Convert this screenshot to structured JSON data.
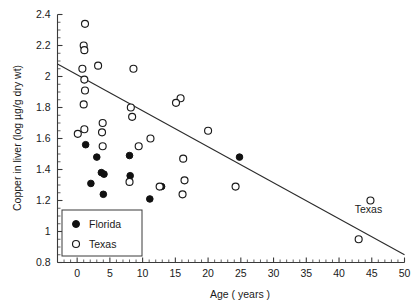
{
  "chart_data": {
    "type": "scatter",
    "title": "",
    "xlabel": "Age ( years )",
    "ylabel": "Copper in liver (log µg/g dry wt)",
    "xlim": [
      -3,
      50
    ],
    "ylim": [
      0.8,
      2.4
    ],
    "xticks": [
      0,
      5,
      10,
      15,
      20,
      25,
      30,
      35,
      40,
      45,
      50
    ],
    "xticklabels": [
      "0",
      "5",
      "10",
      "15",
      "20",
      "25",
      "30",
      "35",
      "40",
      "45",
      "50"
    ],
    "yticks": [
      0.8,
      1.0,
      1.2,
      1.4,
      1.6,
      1.8,
      2.0,
      2.2,
      2.4
    ],
    "yticklabels": [
      "0.8",
      "1",
      "1.2",
      "1.4",
      "1.6",
      "1.8",
      "2",
      "2.2",
      "2.4"
    ],
    "minor_ticks": true,
    "grid": false,
    "legend_position": "lower-left",
    "annotations": [
      {
        "text": "Texas",
        "x": 44.5,
        "y": 1.12
      }
    ],
    "trendline": {
      "name": "regression-line",
      "x_start": -3.0,
      "y_start": 2.08,
      "x_end": 50.0,
      "y_end": 0.85,
      "slope": -0.0232,
      "intercept": 2.01
    },
    "series": [
      {
        "name": "Florida",
        "marker": "filled-circle",
        "color": "#111111",
        "points": [
          {
            "x": 1.3,
            "y": 1.56
          },
          {
            "x": 2.1,
            "y": 1.31
          },
          {
            "x": 3.0,
            "y": 1.48
          },
          {
            "x": 3.7,
            "y": 1.38
          },
          {
            "x": 4.1,
            "y": 1.37
          },
          {
            "x": 4.0,
            "y": 1.24
          },
          {
            "x": 8.0,
            "y": 1.49
          },
          {
            "x": 8.1,
            "y": 1.36
          },
          {
            "x": 11.1,
            "y": 1.21
          },
          {
            "x": 12.9,
            "y": 1.29
          },
          {
            "x": 24.8,
            "y": 1.48
          }
        ]
      },
      {
        "name": "Texas",
        "marker": "open-circle",
        "color": "#ffffff",
        "points": [
          {
            "x": 1.2,
            "y": 2.34
          },
          {
            "x": 1.0,
            "y": 2.2
          },
          {
            "x": 1.1,
            "y": 2.17
          },
          {
            "x": 0.8,
            "y": 2.05
          },
          {
            "x": 3.2,
            "y": 2.07
          },
          {
            "x": 1.1,
            "y": 1.98
          },
          {
            "x": 1.2,
            "y": 1.91
          },
          {
            "x": 1.0,
            "y": 1.82
          },
          {
            "x": 1.1,
            "y": 1.66
          },
          {
            "x": 0.1,
            "y": 1.63
          },
          {
            "x": 3.9,
            "y": 1.7
          },
          {
            "x": 3.8,
            "y": 1.64
          },
          {
            "x": 3.9,
            "y": 1.55
          },
          {
            "x": 8.6,
            "y": 2.05
          },
          {
            "x": 8.2,
            "y": 1.8
          },
          {
            "x": 8.4,
            "y": 1.74
          },
          {
            "x": 8.0,
            "y": 1.32
          },
          {
            "x": 9.4,
            "y": 1.55
          },
          {
            "x": 11.2,
            "y": 1.6
          },
          {
            "x": 12.6,
            "y": 1.29
          },
          {
            "x": 15.8,
            "y": 1.86
          },
          {
            "x": 15.1,
            "y": 1.83
          },
          {
            "x": 16.2,
            "y": 1.47
          },
          {
            "x": 16.4,
            "y": 1.33
          },
          {
            "x": 16.1,
            "y": 1.24
          },
          {
            "x": 20.0,
            "y": 1.65
          },
          {
            "x": 24.2,
            "y": 1.29
          },
          {
            "x": 44.8,
            "y": 1.2
          },
          {
            "x": 43.0,
            "y": 0.95
          }
        ]
      }
    ]
  },
  "legend": {
    "items": [
      {
        "label": "Florida",
        "marker": "filled-circle"
      },
      {
        "label": "Texas",
        "marker": "open-circle"
      }
    ]
  }
}
